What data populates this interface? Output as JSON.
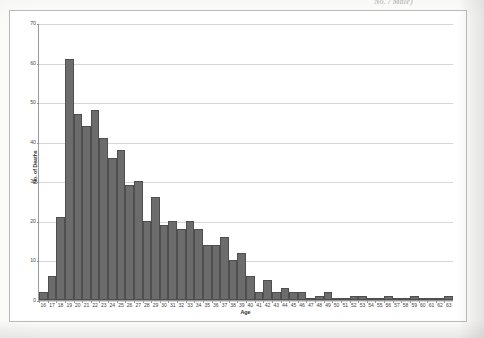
{
  "caption_fragment": "No. / Male)",
  "chart_data": {
    "type": "bar",
    "title": "",
    "subtitle": "",
    "xlabel": "Age",
    "ylabel": "No. of Deaths",
    "ylim": [
      0,
      70
    ],
    "ytick_step": 10,
    "yticks": [
      0,
      10,
      20,
      30,
      40,
      50,
      60,
      70
    ],
    "grid": true,
    "legend": "none",
    "bar_color": "#6c6c6c",
    "bar_border_color": "#4f4f4f",
    "gridline_color": "#d6d6d6",
    "axis_color": "#9a9a9a",
    "categories": [
      "16",
      "17",
      "18",
      "19",
      "20",
      "21",
      "22",
      "23",
      "24",
      "25",
      "26",
      "27",
      "28",
      "29",
      "30",
      "31",
      "32",
      "33",
      "34",
      "35",
      "36",
      "37",
      "38",
      "39",
      "40",
      "41",
      "42",
      "43",
      "44",
      "45",
      "46",
      "47",
      "48",
      "49",
      "50",
      "51",
      "52",
      "53",
      "54",
      "55",
      "56",
      "57",
      "58",
      "59",
      "60",
      "61",
      "62",
      "63"
    ],
    "values": [
      2,
      6,
      21,
      61,
      47,
      44,
      48,
      41,
      36,
      38,
      29,
      30,
      20,
      26,
      19,
      20,
      18,
      20,
      18,
      14,
      14,
      16,
      10,
      12,
      6,
      2,
      5,
      2,
      3,
      2,
      2,
      0,
      1,
      2,
      0,
      0,
      1,
      1,
      0,
      0,
      1,
      0,
      0,
      1,
      0,
      0,
      0,
      1
    ]
  }
}
